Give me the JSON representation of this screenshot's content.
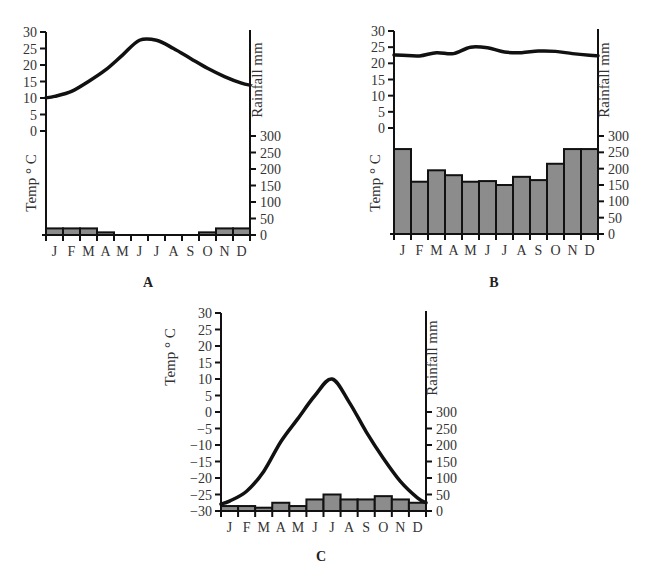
{
  "chart_data": [
    {
      "id": "A",
      "type": "bar+line",
      "panel_label": "A",
      "categories": [
        "J",
        "F",
        "M",
        "A",
        "M",
        "J",
        "J",
        "A",
        "S",
        "O",
        "N",
        "D"
      ],
      "series": [
        {
          "name": "Rainfall mm",
          "type": "bar",
          "axis": "right",
          "values": [
            20,
            20,
            20,
            8,
            0,
            0,
            0,
            0,
            0,
            8,
            20,
            20
          ]
        },
        {
          "name": "Temp °C",
          "type": "line",
          "axis": "left",
          "values": [
            10.5,
            12,
            15,
            18.5,
            23,
            27.5,
            27.5,
            25,
            22,
            19,
            16.5,
            14.5
          ]
        }
      ],
      "ylabel_left": "Temp ° C",
      "ylabel_right": "Rainfall mm",
      "left_ticks": [
        30,
        25,
        20,
        15,
        10,
        5,
        0
      ],
      "right_ticks": [
        300,
        250,
        200,
        150,
        100,
        50,
        0
      ],
      "ylim_left": [
        0,
        30
      ],
      "ylim_right": [
        0,
        300
      ],
      "bar_color": "#8c8c8c",
      "grid": false
    },
    {
      "id": "B",
      "type": "bar+line",
      "panel_label": "B",
      "categories": [
        "J",
        "F",
        "M",
        "A",
        "M",
        "J",
        "J",
        "A",
        "S",
        "O",
        "N",
        "D"
      ],
      "series": [
        {
          "name": "Rainfall mm",
          "type": "bar",
          "axis": "right",
          "values": [
            260,
            160,
            195,
            180,
            160,
            162,
            150,
            175,
            165,
            215,
            260,
            260
          ]
        },
        {
          "name": "Temp °C",
          "type": "line",
          "axis": "left",
          "values": [
            22.5,
            22.3,
            23.3,
            23,
            25,
            24.8,
            23.5,
            23.3,
            23.8,
            23.7,
            23,
            22.5
          ]
        }
      ],
      "ylabel_left": "Temp ° C",
      "ylabel_right": "Rainfall mm",
      "left_ticks": [
        30,
        25,
        20,
        15,
        10,
        5,
        0
      ],
      "right_ticks": [
        300,
        250,
        200,
        150,
        100,
        50,
        0
      ],
      "ylim_left": [
        0,
        30
      ],
      "ylim_right": [
        0,
        300
      ],
      "bar_color": "#8c8c8c",
      "grid": false
    },
    {
      "id": "C",
      "type": "bar+line",
      "panel_label": "C",
      "categories": [
        "J",
        "F",
        "M",
        "A",
        "M",
        "J",
        "J",
        "A",
        "S",
        "O",
        "N",
        "D"
      ],
      "series": [
        {
          "name": "Rainfall mm",
          "type": "bar",
          "axis": "right",
          "values": [
            15,
            15,
            10,
            25,
            15,
            35,
            50,
            35,
            35,
            45,
            35,
            25
          ]
        },
        {
          "name": "Temp °C",
          "type": "line",
          "axis": "left",
          "values": [
            -27,
            -24,
            -18,
            -9,
            -2,
            5,
            10,
            3,
            -6,
            -14,
            -21,
            -26
          ]
        }
      ],
      "ylabel_left": "Temp ° C",
      "ylabel_right": "Rainfall mm",
      "left_ticks": [
        30,
        25,
        20,
        15,
        10,
        5,
        0,
        -5,
        -10,
        -15,
        -20,
        -25,
        -30
      ],
      "right_ticks": [
        300,
        250,
        200,
        150,
        100,
        50,
        0
      ],
      "ylim_left": [
        -30,
        30
      ],
      "ylim_right": [
        0,
        300
      ],
      "bar_color": "#8c8c8c",
      "grid": false
    }
  ],
  "layout": {
    "A": {
      "x0": 46,
      "x1": 250,
      "tempTop": 32,
      "tempZeroY": 131,
      "tempMaxVal": 30,
      "tempMinVal": 0,
      "tempMinY": 131,
      "rainZeroY": 235,
      "rain300Y": 136,
      "axisTop": 32,
      "axisBottom": 235,
      "labelX": 148,
      "labelY": 287,
      "leftTitleX": 36,
      "leftTitleY": 183,
      "rightTitleX": 262,
      "rightTitleY": 80
    },
    "B": {
      "x0": 394,
      "x1": 598,
      "tempTop": 31,
      "tempZeroY": 128,
      "tempMaxVal": 30,
      "tempMinVal": 0,
      "tempMinY": 128,
      "rainZeroY": 234,
      "rain300Y": 136,
      "axisTop": 31,
      "axisBottom": 234,
      "labelX": 494,
      "labelY": 287,
      "leftTitleX": 380,
      "leftTitleY": 183,
      "rightTitleX": 609,
      "rightTitleY": 80
    },
    "C": {
      "x0": 221,
      "x1": 426,
      "tempTop": 313,
      "tempZeroY": 412,
      "tempMaxVal": 30,
      "tempMinVal": -30,
      "tempMinY": 512,
      "rainZeroY": 511,
      "rain300Y": 412,
      "axisTop": 313,
      "axisBottom": 511,
      "labelX": 321,
      "labelY": 561,
      "leftTitleX": 175,
      "leftTitleY": 357,
      "rightTitleX": 437,
      "rightTitleY": 358
    }
  }
}
